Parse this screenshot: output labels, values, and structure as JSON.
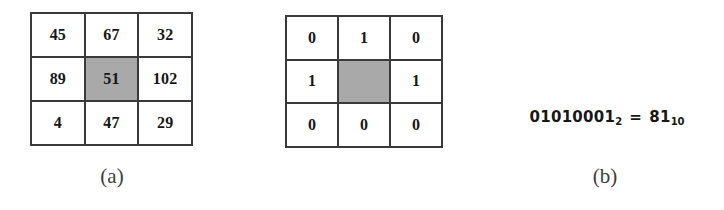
{
  "figure": {
    "panels": [
      {
        "id": "a",
        "caption": "(a)",
        "type": "intensity-grid",
        "rows": [
          [
            {
              "value": "45",
              "shaded": false
            },
            {
              "value": "67",
              "shaded": false
            },
            {
              "value": "32",
              "shaded": false
            }
          ],
          [
            {
              "value": "89",
              "shaded": false
            },
            {
              "value": "51",
              "shaded": true
            },
            {
              "value": "102",
              "shaded": false
            }
          ],
          [
            {
              "value": "4",
              "shaded": false
            },
            {
              "value": "47",
              "shaded": false
            },
            {
              "value": "29",
              "shaded": false
            }
          ]
        ]
      },
      {
        "id": "b",
        "caption": "(b)",
        "type": "binary-grid",
        "rows": [
          [
            {
              "value": "0",
              "shaded": false
            },
            {
              "value": "1",
              "shaded": false
            },
            {
              "value": "0",
              "shaded": false
            }
          ],
          [
            {
              "value": "1",
              "shaded": false
            },
            {
              "value": "",
              "shaded": true
            },
            {
              "value": "1",
              "shaded": false
            }
          ],
          [
            {
              "value": "0",
              "shaded": false
            },
            {
              "value": "0",
              "shaded": false
            },
            {
              "value": "0",
              "shaded": false
            }
          ]
        ]
      },
      {
        "id": "c",
        "caption": "(c)",
        "type": "equation",
        "equation": {
          "left_value": "01010001",
          "left_subscript": "2",
          "operator": "=",
          "right_value": "81",
          "right_subscript": "10"
        }
      }
    ]
  },
  "colors": {
    "shaded_cell": "#a9a9a9",
    "cell_background": "#ffffff",
    "grid_line": "#3a3a3a",
    "text": "#171717",
    "caption_text": "#3d3d3d",
    "page_background": "#ffffff"
  }
}
